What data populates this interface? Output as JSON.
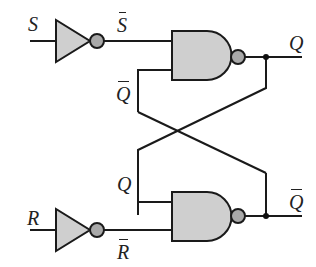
{
  "diagram": {
    "colors": {
      "wire": "#1a1a1a",
      "gate_fill": "#cfcfcf",
      "bubble_fill": "#a9a9a9",
      "background": "#ffffff"
    },
    "labels": {
      "S": "S",
      "S_bar": "S",
      "R": "R",
      "R_bar": "R",
      "Q_out": "Q",
      "Q_bar_out": "Q",
      "Q_bar_feedback": "Q",
      "Q_feedback": "Q"
    },
    "components": [
      {
        "id": "inv-s",
        "type": "NOT",
        "input": "S",
        "output": "S̄"
      },
      {
        "id": "nand-top",
        "type": "NAND",
        "inputs": [
          "S̄",
          "Q̄"
        ],
        "output": "Q"
      },
      {
        "id": "inv-r",
        "type": "NOT",
        "input": "R",
        "output": "R̄"
      },
      {
        "id": "nand-bottom",
        "type": "NAND",
        "inputs": [
          "Q",
          "R̄"
        ],
        "output": "Q̄"
      }
    ]
  }
}
